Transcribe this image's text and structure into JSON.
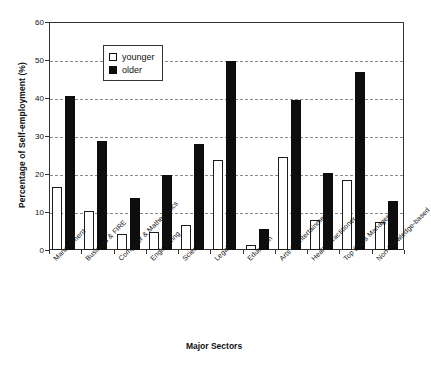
{
  "chart_data": {
    "type": "bar",
    "title": "",
    "xlabel": "Major Sectors",
    "ylabel": "Percentage of Self-employment (%)",
    "ylim": [
      0,
      60
    ],
    "yticks": [
      0,
      10,
      20,
      30,
      40,
      50,
      60
    ],
    "grid": true,
    "legend_position": "top-left-inside",
    "categories": [
      "Management",
      "Business & FIRE",
      "Computer & Mathematics",
      "Engineering",
      "Science",
      "Legal",
      "Education",
      "Arts & Entertainment",
      "Health Practitioner",
      "Top Sales Managers",
      "Non-knowledge-based"
    ],
    "series": [
      {
        "name": "younger",
        "color": "#ffffff",
        "values": [
          16.5,
          10.3,
          4.3,
          4.7,
          6.5,
          23.8,
          1.4,
          24.5,
          7.8,
          18.5,
          7.3
        ]
      },
      {
        "name": "older",
        "color": "#0d0d0d",
        "values": [
          40.5,
          28.7,
          13.8,
          19.8,
          28.0,
          49.7,
          5.6,
          39.5,
          20.3,
          46.8,
          13.0
        ]
      }
    ]
  }
}
